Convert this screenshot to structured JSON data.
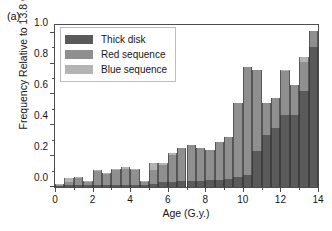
{
  "figure": {
    "panel_label": "(a)",
    "background_color": "#ffffff",
    "frame_color": "#4d4d4d"
  },
  "chart_data": {
    "type": "bar",
    "subtype": "stacked-histogram",
    "title": "",
    "xlabel": "Age (G.y.)",
    "ylabel": "Frequency Relative to 13.8 G.y.",
    "xlim": [
      0,
      14
    ],
    "ylim": [
      0.0,
      1.05
    ],
    "xticks": [
      0,
      2,
      4,
      6,
      8,
      10,
      12,
      14
    ],
    "xtick_labels": [
      "0",
      "2",
      "4",
      "6",
      "8",
      "10",
      "12",
      "14"
    ],
    "xticks_minor": [
      1,
      3,
      5,
      7,
      9,
      11,
      13
    ],
    "yticks": [
      0.0,
      0.2,
      0.4,
      0.6,
      0.8,
      1.0
    ],
    "ytick_labels": [
      "0.0",
      "0.2",
      "0.4",
      "0.6",
      "0.8",
      "1.0"
    ],
    "yticks_minor": [
      0.1,
      0.3,
      0.5,
      0.7,
      0.9
    ],
    "grid": false,
    "legend_position": "top-left",
    "bin_width": 0.5,
    "bin_starts": [
      0.0,
      0.5,
      1.0,
      1.5,
      2.0,
      2.5,
      3.0,
      3.5,
      4.0,
      4.5,
      5.0,
      5.5,
      6.0,
      6.5,
      7.0,
      7.5,
      8.0,
      8.5,
      9.0,
      9.5,
      10.0,
      10.5,
      11.0,
      11.5,
      12.0,
      12.5,
      13.0,
      13.5
    ],
    "series": [
      {
        "name": "Thick disk",
        "color": "#5a5a5a",
        "values": [
          0.005,
          0.01,
          0.01,
          0.01,
          0.012,
          0.012,
          0.014,
          0.014,
          0.012,
          0.01,
          0.02,
          0.03,
          0.035,
          0.04,
          0.04,
          0.04,
          0.045,
          0.045,
          0.055,
          0.065,
          0.075,
          0.235,
          0.34,
          0.38,
          0.47,
          0.47,
          0.62,
          0.91
        ]
      },
      {
        "name": "Red sequence",
        "color": "#8f8f8f",
        "values": [
          0.01,
          0.022,
          0.05,
          0.024,
          0.09,
          0.077,
          0.097,
          0.106,
          0.1,
          0.022,
          0.09,
          0.11,
          0.175,
          0.215,
          0.232,
          0.21,
          0.195,
          0.245,
          0.27,
          0.48,
          0.705,
          0.525,
          0.205,
          0.2,
          0.28,
          0.19,
          0.19,
          0.1
        ]
      },
      {
        "name": "Blue sequence",
        "color": "#b4b4b4",
        "values": [
          0.005,
          0.028,
          0.002,
          0.004,
          0.006,
          0.001,
          0.005,
          0.01,
          0.008,
          0.01,
          0.046,
          0.018,
          0.012,
          0.0,
          0.0,
          0.0,
          0.0,
          0.0,
          0.0,
          0.0,
          0.0,
          0.0,
          0.0,
          0.0,
          0.01,
          0.0,
          0.035,
          0.0
        ]
      }
    ],
    "totals": [
      0.02,
      0.06,
      0.062,
      0.038,
      0.108,
      0.09,
      0.116,
      0.13,
      0.12,
      0.042,
      0.156,
      0.158,
      0.222,
      0.255,
      0.272,
      0.25,
      0.24,
      0.29,
      0.325,
      0.545,
      0.78,
      0.76,
      0.545,
      0.58,
      0.76,
      0.66,
      0.845,
      1.01
    ]
  },
  "legend": {
    "items": [
      {
        "label": "Thick disk",
        "color": "#5a5a5a"
      },
      {
        "label": "Red sequence",
        "color": "#8f8f8f"
      },
      {
        "label": "Blue sequence",
        "color": "#b4b4b4"
      }
    ]
  }
}
